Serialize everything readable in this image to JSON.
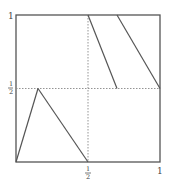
{
  "diagram": {
    "frame": {
      "left": 16,
      "top": 15,
      "right": 160,
      "bottom": 162
    },
    "stroke_color": "#555555",
    "dash_color": "#888888",
    "labels": {
      "y_top": "1",
      "y_half_num": "1",
      "y_half_den": "2",
      "x_half_num": "1",
      "x_half_den": "2",
      "x_right": "1"
    },
    "segments": [
      {
        "name": "triangle-left-edge",
        "from": [
          0,
          0
        ],
        "to": [
          0.153,
          0.5
        ]
      },
      {
        "name": "triangle-right-edge",
        "from": [
          0.153,
          0.5
        ],
        "to": [
          0.5,
          0
        ]
      },
      {
        "name": "upper-line-1",
        "from": [
          0.5,
          1
        ],
        "to": [
          0.7,
          0.5
        ]
      },
      {
        "name": "upper-line-2",
        "from": [
          0.7,
          1
        ],
        "to": [
          1,
          0.5
        ]
      }
    ],
    "guides": [
      {
        "name": "horizontal-half-guide",
        "from": [
          0,
          0.5
        ],
        "to": [
          1,
          0.5
        ]
      },
      {
        "name": "vertical-half-guide",
        "from": [
          0.5,
          0
        ],
        "to": [
          0.5,
          1
        ]
      }
    ]
  }
}
